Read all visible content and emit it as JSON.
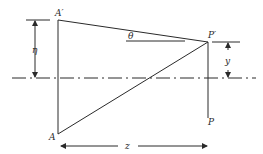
{
  "diagram": {
    "labels": {
      "A_prime": "A′",
      "A": "A",
      "P_prime": "P′",
      "P": "P",
      "theta": "θ",
      "eta": "η",
      "y": "y",
      "z": "z"
    },
    "colors": {
      "stroke": "#2a2a2a",
      "background": "#ffffff"
    }
  }
}
